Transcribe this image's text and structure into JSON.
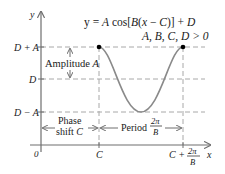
{
  "equation": {
    "line1": "y = A cos[B(x − C)] + D",
    "line1_parts": [
      "y = ",
      "A",
      " cos[",
      "B",
      "(",
      "x",
      " − ",
      "C",
      ")] + ",
      "D"
    ],
    "line2": "A, B, C, D > 0"
  },
  "axes": {
    "y_label": "y",
    "x_label": "x",
    "origin_label": "0"
  },
  "y_ticks": {
    "top": "D + A",
    "mid": "D",
    "bottom": "D − A"
  },
  "x_ticks": {
    "c": "C",
    "c_plus": "C +",
    "frac_num": "2π",
    "frac_den": "B"
  },
  "annotations": {
    "amplitude": "Amplitude",
    "amplitude_var": "A",
    "phase_line1": "Phase",
    "phase_line2": "shift",
    "phase_var": "C",
    "period": "Period",
    "period_num": "2π",
    "period_den": "B"
  },
  "colors": {
    "curve": "#8a8a8a",
    "axis": "#6e6e6e",
    "dashed": "#a8a8a8",
    "point": "#000000",
    "text": "#1a1a1a"
  }
}
